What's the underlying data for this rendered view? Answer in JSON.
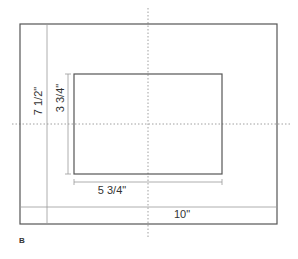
{
  "figure_label": "B",
  "outer_frame": {
    "width_label": "10\"",
    "height_label": "7 1/2\""
  },
  "inner_opening": {
    "width_label": "5 3/4\"",
    "height_label": "3 3/4\""
  },
  "colors": {
    "frame_line": "#555555",
    "dim_line": "#999999",
    "center_line": "#888888",
    "text": "#333333"
  }
}
